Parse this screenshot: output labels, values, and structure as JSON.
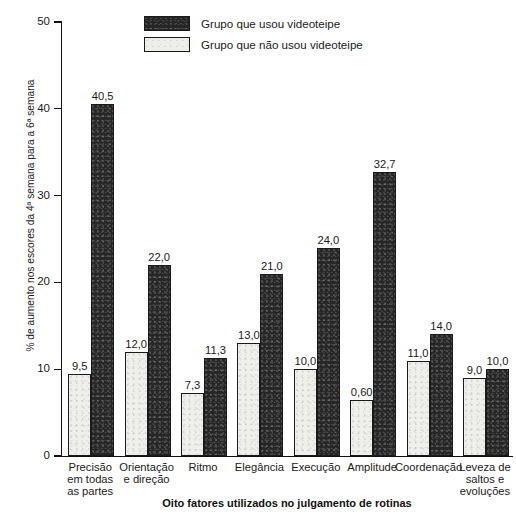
{
  "page_mark": "",
  "chart_data": {
    "type": "bar",
    "title": "",
    "xlabel": "Oito fatores utilizados no julgamento de rotinas",
    "ylabel": "% de aumento nos escores da 4ª semana para a 6ª semana",
    "ylim": [
      0,
      50
    ],
    "yticks": [
      0,
      10,
      20,
      30,
      40,
      50
    ],
    "ytick_labels": [
      "0",
      "10",
      "20",
      "30",
      "40",
      "50"
    ],
    "grid": false,
    "legend_position": "top-center",
    "categories": [
      "Precisão\nem todas\nas partes",
      "Orientação\ne direção",
      "Ritmo",
      "Elegância",
      "Execução",
      "Amplitude",
      "Coordenação",
      "Leveza de\nsaltos e\nevoluções"
    ],
    "category_lines": [
      [
        "Precisão",
        "em todas",
        "as partes"
      ],
      [
        "Orientação",
        "e direção"
      ],
      [
        "Ritmo"
      ],
      [
        "Elegância"
      ],
      [
        "Execução"
      ],
      [
        "Amplitude"
      ],
      [
        "Coordenação"
      ],
      [
        "Leveza de",
        "saltos e",
        "evoluções"
      ]
    ],
    "series": [
      {
        "name": "Grupo que não usou videoteipe",
        "color": "#efefeb",
        "values": [
          9.5,
          12.0,
          7.3,
          13.0,
          10.0,
          0.6,
          11.0,
          9.0
        ],
        "value_labels": [
          "9,5",
          "12,0",
          "7,3",
          "13,0",
          "10,0",
          "0,60",
          "11,0",
          "9,0"
        ],
        "plotted_heights": [
          9.5,
          12.0,
          7.3,
          13.0,
          10.0,
          6.5,
          11.0,
          9.0
        ]
      },
      {
        "name": "Grupo que usou videoteipe",
        "color": "#262626",
        "values": [
          40.5,
          22.0,
          11.3,
          21.0,
          24.0,
          32.7,
          14.0,
          10.0
        ],
        "value_labels": [
          "40,5",
          "22,0",
          "11,3",
          "21,0",
          "24,0",
          "32,7",
          "14,0",
          "10,0"
        ],
        "plotted_heights": [
          40.5,
          22.0,
          11.3,
          21.0,
          24.0,
          32.7,
          14.0,
          10.0
        ]
      }
    ]
  },
  "legend": {
    "items": [
      {
        "label": "Grupo que usou videoteipe",
        "swatch": "dark"
      },
      {
        "label": "Grupo que não usou videoteipe",
        "swatch": "light"
      }
    ]
  }
}
